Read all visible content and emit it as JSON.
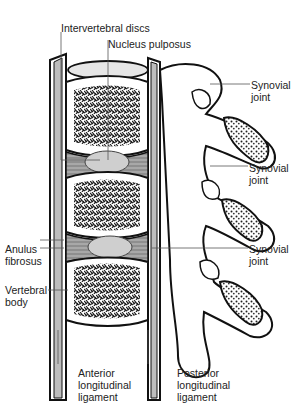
{
  "diagram": {
    "type": "anatomical illustration",
    "labels": {
      "intervertebral_discs": "Intervertebral discs",
      "nucleus_pulposus": "Nucleus pulposus",
      "synovial_joint_1": [
        "Synovial",
        "joint"
      ],
      "synovial_joint_2": [
        "Synovial",
        "joint"
      ],
      "synovial_joint_3": [
        "Synovial",
        "joint"
      ],
      "anulus_fibrosus": [
        "Anulus",
        "fibrosus"
      ],
      "vertebral_body": [
        "Vertebral",
        "body"
      ],
      "anterior_ligament": [
        "Anterior",
        "longitudinal",
        "ligament"
      ],
      "posterior_ligament": [
        "Posterior",
        "longitudinal",
        "ligament"
      ]
    },
    "colors": {
      "outline": "#111111",
      "cancellous_bone": "#2a2a2a",
      "disc_nucleus": "#c8c8c8",
      "disc_annulus": "#9a9a9a",
      "ligament_fill": "#bdbdbd",
      "leader_line": "#555555"
    }
  }
}
